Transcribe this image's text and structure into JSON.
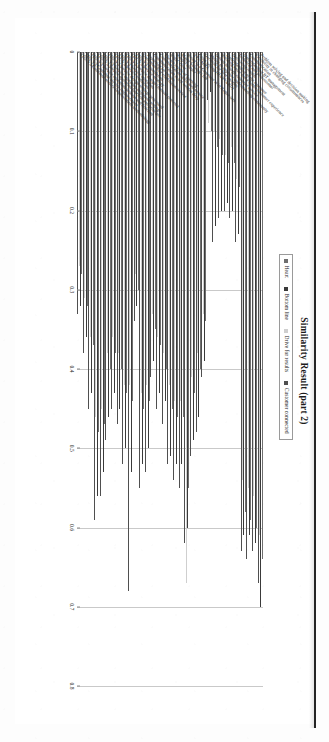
{
  "page": {
    "binding_edge_color": "#111111"
  },
  "chart_data": {
    "type": "bar",
    "orientation": "vertical-rotated",
    "title": "Similarity Result (part 2)",
    "xlabel": "",
    "ylabel": "",
    "ylim": [
      0,
      0.8
    ],
    "grid": true,
    "legend_position": "top-right",
    "tick_labels": [
      "0",
      "0.1",
      "0.2",
      "0.3",
      "0.4",
      "0.5",
      "0.6",
      "0.7",
      "0.8"
    ],
    "tick_values": [
      0,
      0.1,
      0.2,
      0.3,
      0.4,
      0.5,
      0.6,
      0.7,
      0.8
    ],
    "legend": [
      {
        "name": "Heart",
        "color": "#6f6f6f"
      },
      {
        "name": "Bottom line",
        "color": "#3a3a3a"
      },
      {
        "name": "Drive for results",
        "color": "#cfcfcf"
      },
      {
        "name": "Customer connected",
        "color": "#4f4f4f"
      }
    ],
    "categories": [
      "Problem solving and decision making",
      "Flexibility in changing circumstances",
      "Communication",
      "Understanding BT management",
      "Technical and professional",
      "Delivering results",
      "Understanding of the customer",
      "Building value and a better customer experience",
      "Driven through customer service",
      "Ability to improve understanding community",
      "Decision for best insights",
      "Cross selling (HARVARD)",
      "3 Pic MBA",
      "Being in a Customer is in Rogue sets",
      "Major Valuing / LB",
      "Keep it simple",
      "Right, clear",
      "The six levels of learning",
      "Communication skills web service",
      "Communication is not written deep",
      "Reporting for results",
      "Understanding continuous review",
      "ITIL V3 Foundation",
      "ITIL V3 Service strategy",
      "ITIL V3 Service design (manual process)",
      "ITIL V3 Service operation",
      "ITIL V3 Service transition",
      "ITIL V3 Service design settings processed",
      "ITIL V3 Service operation minimum settings",
      "ITIL V3 Service operation function and principle",
      "ITIL V3 Service operation process and function",
      "ITIL V3 Continual service improvement",
      "ITIL V3 Continual service improvement methodology"
    ],
    "series": [
      {
        "name": "Heart",
        "color": "#6f6f6f",
        "values": [
          0.64,
          0.6,
          0.59,
          0.58,
          0.17,
          0.14,
          0.14,
          0.13,
          0.12,
          0.1,
          0.34,
          0.4,
          0.43,
          0.55,
          0.46,
          0.46,
          0.45,
          0.4,
          0.37,
          0.35,
          0.44,
          0.45,
          0.3,
          0.44,
          0.43,
          0.4,
          0.38,
          0.4,
          0.47,
          0.48,
          0.37,
          0.32,
          0.28
        ]
      },
      {
        "name": "Bottom line",
        "color": "#3a3a3a",
        "values": [
          0.7,
          0.62,
          0.61,
          0.61,
          0.23,
          0.2,
          0.19,
          0.2,
          0.22,
          0.05,
          0.39,
          0.46,
          0.49,
          0.6,
          0.52,
          0.52,
          0.51,
          0.44,
          0.43,
          0.39,
          0.5,
          0.52,
          0.32,
          0.53,
          0.5,
          0.45,
          0.43,
          0.46,
          0.53,
          0.56,
          0.43,
          0.36,
          0.32
        ]
      },
      {
        "name": "Drive for results",
        "color": "#cfcfcf",
        "values": [
          0.61,
          0.56,
          0.55,
          0.54,
          0.16,
          0.12,
          0.13,
          0.11,
          0.1,
          0.09,
          0.33,
          0.38,
          0.41,
          0.67,
          0.44,
          0.44,
          0.42,
          0.38,
          0.36,
          0.33,
          0.42,
          0.43,
          0.28,
          0.42,
          0.42,
          0.38,
          0.36,
          0.38,
          0.45,
          0.46,
          0.36,
          0.31,
          0.27
        ]
      },
      {
        "name": "Customer connected",
        "color": "#4f4f4f",
        "values": [
          0.67,
          0.63,
          0.64,
          0.63,
          0.24,
          0.21,
          0.2,
          0.21,
          0.24,
          0.06,
          0.41,
          0.48,
          0.51,
          0.62,
          0.55,
          0.54,
          0.52,
          0.47,
          0.45,
          0.41,
          0.53,
          0.55,
          0.34,
          0.68,
          0.52,
          0.47,
          0.45,
          0.49,
          0.56,
          0.59,
          0.45,
          0.38,
          0.33
        ]
      }
    ]
  }
}
